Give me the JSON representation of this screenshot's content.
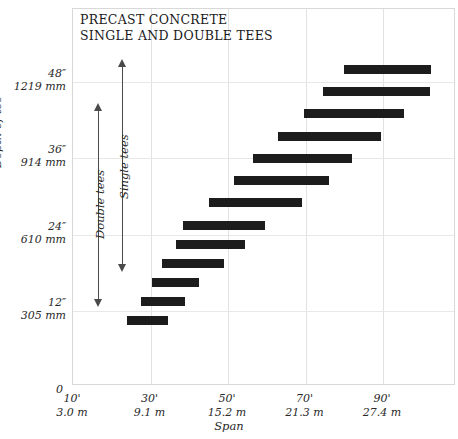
{
  "chart_data": {
    "type": "bar",
    "orientation": "horizontal-range",
    "title": "PRECAST CONCRETE",
    "subtitle": "SINGLE AND DOUBLE TEES",
    "xlabel": "Span",
    "ylabel": "Depth of tee",
    "grid": true,
    "legend": false,
    "xlim_ft": [
      10,
      100
    ],
    "ylim_in": [
      4,
      54
    ],
    "x_ticks": [
      {
        "feet": "10'",
        "meters": "3.0 m",
        "value_ft": 10
      },
      {
        "feet": "30'",
        "meters": "9.1 m",
        "value_ft": 30
      },
      {
        "feet": "50'",
        "meters": "15.2 m",
        "value_ft": 50
      },
      {
        "feet": "70'",
        "meters": "21.3 m",
        "value_ft": 70
      },
      {
        "feet": "90'",
        "meters": "27.4 m",
        "value_ft": 90
      }
    ],
    "origin_label": "0",
    "y_ticks": [
      {
        "inches": "48″",
        "mm": "1219 mm",
        "value_in": 48
      },
      {
        "inches": "36″",
        "mm": "914 mm",
        "value_in": 36
      },
      {
        "inches": "24″",
        "mm": "610 mm",
        "value_in": 24
      },
      {
        "inches": "12″",
        "mm": "305 mm",
        "value_in": 12
      }
    ],
    "annotations": [
      {
        "label": "Double tees",
        "type": "range-arrow",
        "depth_top_in": 44.5,
        "depth_bottom_in": 12.5
      },
      {
        "label": "Single tees",
        "type": "range-arrow",
        "depth_top_in": 51.5,
        "depth_bottom_in": 18.0
      }
    ],
    "bars": [
      {
        "span_start_ft": 80.0,
        "span_end_ft": 102.5,
        "depth_in": 50.0
      },
      {
        "span_start_ft": 74.5,
        "span_end_ft": 102.0,
        "depth_in": 46.5
      },
      {
        "span_start_ft": 69.5,
        "span_end_ft": 95.5,
        "depth_in": 43.0
      },
      {
        "span_start_ft": 63.0,
        "span_end_ft": 89.5,
        "depth_in": 39.5
      },
      {
        "span_start_ft": 56.5,
        "span_end_ft": 82.0,
        "depth_in": 36.0
      },
      {
        "span_start_ft": 51.5,
        "span_end_ft": 76.0,
        "depth_in": 32.5
      },
      {
        "span_start_ft": 45.0,
        "span_end_ft": 69.0,
        "depth_in": 29.0
      },
      {
        "span_start_ft": 38.5,
        "span_end_ft": 59.5,
        "depth_in": 25.5
      },
      {
        "span_start_ft": 36.5,
        "span_end_ft": 54.5,
        "depth_in": 22.5
      },
      {
        "span_start_ft": 33.0,
        "span_end_ft": 49.0,
        "depth_in": 19.5
      },
      {
        "span_start_ft": 30.5,
        "span_end_ft": 42.5,
        "depth_in": 16.5
      },
      {
        "span_start_ft": 27.5,
        "span_end_ft": 39.0,
        "depth_in": 13.5
      },
      {
        "span_start_ft": 24.0,
        "span_end_ft": 34.5,
        "depth_in": 10.5
      }
    ]
  }
}
